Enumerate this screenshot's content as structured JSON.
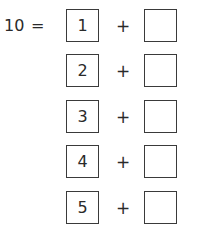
{
  "equation": {
    "total": "10",
    "equals_sign": "=",
    "operator": "+",
    "rows": [
      {
        "addend": "1",
        "blank": ""
      },
      {
        "addend": "2",
        "blank": ""
      },
      {
        "addend": "3",
        "blank": ""
      },
      {
        "addend": "4",
        "blank": ""
      },
      {
        "addend": "5",
        "blank": ""
      }
    ]
  }
}
